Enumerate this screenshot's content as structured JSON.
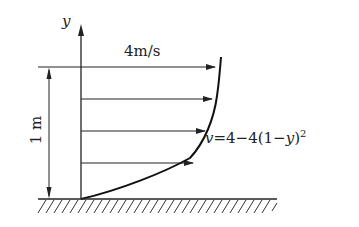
{
  "diagram": {
    "axis": {
      "label": "y"
    },
    "max_velocity_label": "4m/s",
    "height_label": "1 m",
    "formula": {
      "lhs": "v",
      "rhs": "=4−4(1−",
      "var": "y",
      "close": ")",
      "exp": "2"
    },
    "arrows": [
      {
        "y": 67,
        "x_end": 215
      },
      {
        "y": 99,
        "x_end": 212
      },
      {
        "y": 131,
        "x_end": 205
      },
      {
        "y": 163,
        "x_end": 193
      }
    ],
    "colors": {
      "ink": "#222222",
      "background": "#ffffff"
    }
  }
}
